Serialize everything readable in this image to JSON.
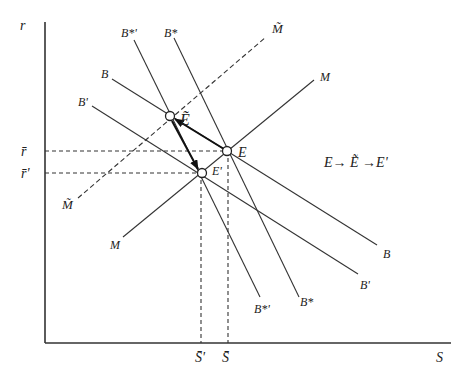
{
  "diagram": {
    "axes": {
      "y_label": "r",
      "x_label": "S"
    },
    "y_ticks": {
      "r_bar": "r̄",
      "r_bar_prime": "r̄'"
    },
    "x_ticks": {
      "s_bar_prime": "S̄'",
      "s_bar": "S̄"
    },
    "curves": {
      "B": "B",
      "B_prime": "B'",
      "B_star": "B*",
      "B_star_prime": "B*'",
      "M": "M",
      "M_tilde": "M̃"
    },
    "points": {
      "E": "E",
      "E_tilde": "Ẽ",
      "E_prime": "E'"
    },
    "annotation": "E→ Ẽ →E'"
  }
}
